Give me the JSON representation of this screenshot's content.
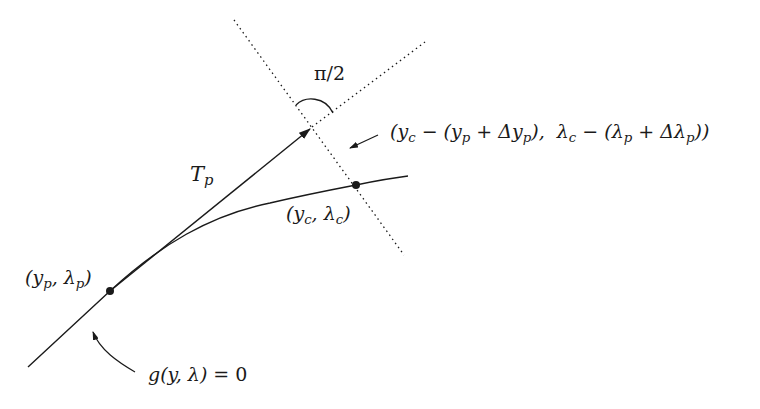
{
  "diagram": {
    "labels": {
      "angle": "π/2",
      "tangent": "T",
      "tangent_sub": "p",
      "correction_vector": "(y_c − (y_p + Δy_p),  λ_c − (λ_p + Δλ_p))",
      "corrected_point": "(y_c, λ_c)",
      "predicted_point": "(y_p, λ_p)",
      "curve_equation": "g(y, λ) = 0"
    },
    "points": {
      "yp_lambda_p": {
        "x": 110,
        "y": 291
      },
      "yc_lambda_c": {
        "x": 356,
        "y": 185
      },
      "tangent_tip": {
        "x": 312,
        "y": 127
      }
    },
    "colors": {
      "stroke": "#1a1a1a",
      "background": "#ffffff"
    }
  }
}
